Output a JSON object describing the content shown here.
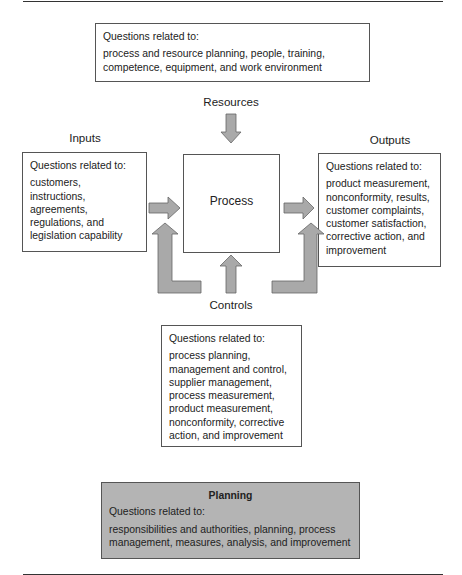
{
  "diagram": {
    "type": "process-model",
    "top_box": {
      "heading": "Questions related to:",
      "lines": [
        "process and resource planning, people, training,",
        "competence, equipment, and work environment"
      ]
    },
    "labels": {
      "resources": "Resources",
      "inputs": "Inputs",
      "outputs": "Outputs",
      "controls": "Controls",
      "process": "Process"
    },
    "inputs_box": {
      "heading": "Questions related to:",
      "lines": [
        "customers,",
        "instructions,",
        "agreements,",
        "regulations, and",
        "legislation capability"
      ]
    },
    "outputs_box": {
      "heading": "Questions related to:",
      "lines": [
        "product measurement,",
        "nonconformity, results,",
        "customer complaints,",
        "customer satisfaction,",
        "corrective action, and",
        "improvement"
      ]
    },
    "controls_box": {
      "heading": "Questions related to:",
      "lines": [
        "process planning,",
        "management and control,",
        "supplier management,",
        "process measurement,",
        "product measurement,",
        "nonconformity, corrective",
        "action, and improvement"
      ]
    },
    "planning_box": {
      "title": "Planning",
      "heading": "Questions related to:",
      "lines": [
        "responsibilities and authorities, planning, process",
        "management, measures, analysis, and improvement"
      ]
    },
    "colors": {
      "arrow_fill": "#a9a9a9",
      "arrow_stroke": "#666666",
      "planning_bg": "#b4b4b4",
      "border": "#555555"
    }
  }
}
